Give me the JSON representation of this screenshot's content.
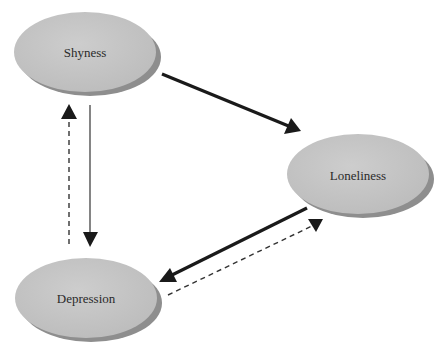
{
  "diagram": {
    "type": "causal-relationship-diagram",
    "colors": {
      "node_fill": "#c4c4c4",
      "node_shadow": "#8a8a8a",
      "node_text": "#2a2a2a",
      "edge": "#1a1a1a",
      "background": "#ffffff"
    },
    "nodes": [
      {
        "id": "shyness",
        "label": "Shyness"
      },
      {
        "id": "loneliness",
        "label": "Loneliness"
      },
      {
        "id": "depression",
        "label": "Depression"
      }
    ],
    "edges": [
      {
        "from": "Shyness",
        "to": "Loneliness",
        "style": "solid-thick"
      },
      {
        "from": "Shyness",
        "to": "Depression",
        "style": "solid-thin"
      },
      {
        "from": "Depression",
        "to": "Shyness",
        "style": "dashed"
      },
      {
        "from": "Loneliness",
        "to": "Depression",
        "style": "solid-thick"
      },
      {
        "from": "Depression",
        "to": "Loneliness",
        "style": "dashed"
      }
    ]
  }
}
